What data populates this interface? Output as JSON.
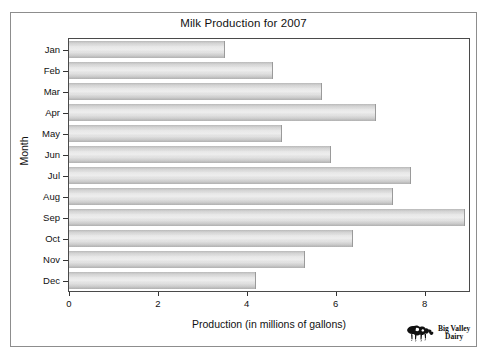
{
  "chart_data": {
    "type": "bar",
    "orientation": "horizontal",
    "title": "Milk Production for 2007",
    "xlabel": "Production (in millions of gallons)",
    "ylabel": "Month",
    "categories": [
      "Jan",
      "Feb",
      "Mar",
      "Apr",
      "May",
      "Jun",
      "Jul",
      "Aug",
      "Sep",
      "Oct",
      "Nov",
      "Dec"
    ],
    "values": [
      3.5,
      4.6,
      5.7,
      6.9,
      4.8,
      5.9,
      7.7,
      7.3,
      8.9,
      6.4,
      5.3,
      4.2
    ],
    "xlim": [
      0,
      9
    ],
    "xticks": [
      0,
      2,
      4,
      6,
      8
    ],
    "xtick_labels": [
      "0",
      "2",
      "4",
      "6",
      "8"
    ],
    "grid": false,
    "legend": null,
    "bar_color": "#e0e0e0",
    "bar_edge_color": "#9a9a9a"
  },
  "logo": {
    "icon": "cow-icon",
    "line1": "Big Valley",
    "line2": "Dairy"
  }
}
